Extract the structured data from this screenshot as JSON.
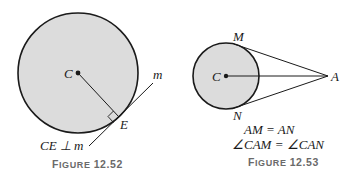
{
  "figure_52": {
    "center_label": "C",
    "point_label": "E",
    "line_label": "m",
    "statement": "CE ⊥ m",
    "caption_prefix": "F",
    "caption_small": "IGURE",
    "caption_number": "12.52"
  },
  "figure_53": {
    "center_label": "C",
    "top_label": "M",
    "bottom_label": "N",
    "external_label": "A",
    "statement_1": "AM = AN",
    "statement_2": "∠CAM = ∠CAN",
    "caption_prefix": "F",
    "caption_small": "IGURE",
    "caption_number": "12.53"
  },
  "colors": {
    "circle_fill": "#dcdcdc",
    "stroke": "#1a1a1a",
    "caption": "#6a6a6a"
  }
}
